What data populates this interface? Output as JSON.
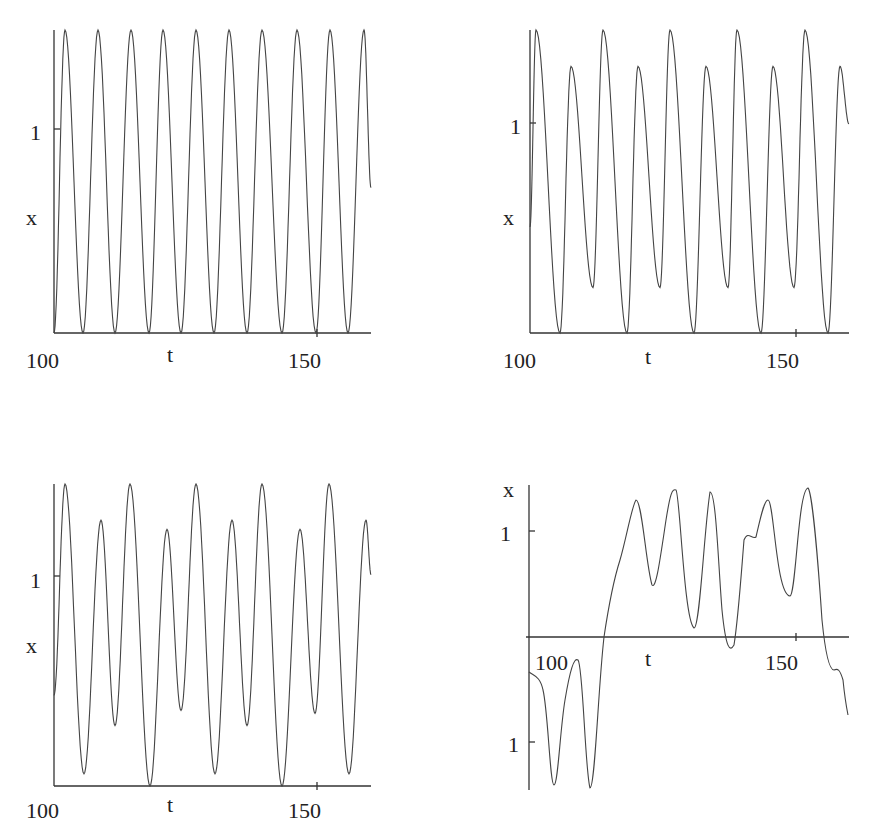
{
  "chart_data": [
    {
      "type": "line",
      "title": "",
      "xlabel": "t",
      "ylabel": "x",
      "xlim": [
        100,
        162
      ],
      "x_ticks": [
        "100",
        "150"
      ],
      "y_ticks": [
        "1"
      ],
      "description": "Periodic oscillation, equal peaks, period ~3.7",
      "peaks_t": [
        103.5,
        112.5,
        117.5,
        123,
        128,
        133,
        138,
        144,
        149.5,
        155
      ],
      "peak_value": 1.0,
      "trough_value": 0
    },
    {
      "type": "line",
      "title": "",
      "xlabel": "t",
      "ylabel": "x",
      "xlim": [
        100,
        162
      ],
      "x_ticks": [
        "100",
        "150"
      ],
      "y_ticks": [
        "1"
      ],
      "description": "Period-2 oscillation: alternating high/low peaks and troughs"
    },
    {
      "type": "line",
      "title": "",
      "xlabel": "t",
      "ylabel": "x",
      "xlim": [
        100,
        162
      ],
      "x_ticks": [
        "100",
        "150"
      ],
      "y_ticks": [
        "1"
      ],
      "description": "Quasi-periodic oscillation with varying peak and trough heights"
    },
    {
      "type": "line",
      "title": "",
      "xlabel": "t",
      "ylabel": "x",
      "xlim": [
        100,
        162
      ],
      "x_ticks": [
        "100",
        "150"
      ],
      "y_ticks": [
        "1",
        "-1"
      ],
      "y_tick_labels_shown": [
        "1",
        "1"
      ],
      "description": "Chaotic oscillation switching between negative and positive regions"
    }
  ],
  "labels": {
    "x_axis": "t",
    "y_axis": "x",
    "tick_100": "100",
    "tick_150": "150",
    "tick_1": "1"
  }
}
